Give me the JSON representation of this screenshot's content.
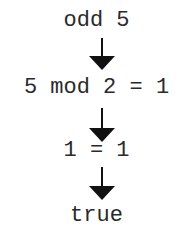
{
  "diagram": {
    "type": "evaluation-steps",
    "steps": [
      {
        "expression": "odd 5"
      },
      {
        "expression": "5 mod 2 = 1"
      },
      {
        "expression": "1 = 1"
      },
      {
        "expression": "true"
      }
    ],
    "arrow_icon": "down-arrow-icon",
    "colors": {
      "text": "#2a2a2a",
      "arrow": "#111111",
      "background": "#ffffff"
    }
  }
}
